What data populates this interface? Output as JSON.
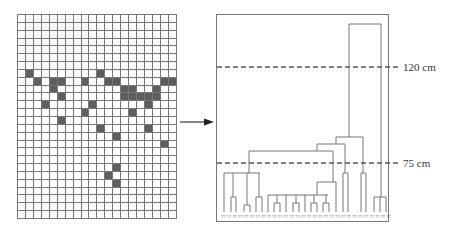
{
  "grid": {
    "cols": 20,
    "rows": 26,
    "cell_w": 7.95,
    "cell_h": 7.85,
    "filled_cells": [
      [
        7,
        1
      ],
      [
        7,
        10
      ],
      [
        8,
        2
      ],
      [
        8,
        4
      ],
      [
        8,
        5
      ],
      [
        8,
        8
      ],
      [
        8,
        11
      ],
      [
        8,
        12
      ],
      [
        8,
        18
      ],
      [
        8,
        19
      ],
      [
        9,
        4
      ],
      [
        9,
        13
      ],
      [
        9,
        14
      ],
      [
        9,
        17
      ],
      [
        10,
        5
      ],
      [
        10,
        13
      ],
      [
        10,
        14
      ],
      [
        10,
        15
      ],
      [
        10,
        16
      ],
      [
        10,
        17
      ],
      [
        11,
        3
      ],
      [
        11,
        9
      ],
      [
        11,
        16
      ],
      [
        12,
        8
      ],
      [
        12,
        14
      ],
      [
        13,
        5
      ],
      [
        14,
        10
      ],
      [
        14,
        16
      ],
      [
        15,
        12
      ],
      [
        16,
        18
      ],
      [
        19,
        12
      ],
      [
        20,
        11
      ],
      [
        21,
        12
      ]
    ]
  },
  "arrow": {
    "label": ""
  },
  "dendrogram": {
    "thresholds": [
      {
        "label": "120 cm",
        "y": 67
      },
      {
        "label": "75 cm",
        "y": 163
      }
    ],
    "leaf_label": "??",
    "leaf_count": 30
  },
  "chart_data": {
    "type": "dendrogram",
    "title": "",
    "annotations": [
      "120 cm",
      "75 cm"
    ],
    "cut_heights_cm": [
      120,
      75
    ],
    "leaf_labels": [
      "??",
      "??",
      "??",
      "??",
      "??",
      "??",
      "??",
      "??",
      "??",
      "??",
      "??",
      "??",
      "??",
      "??",
      "??",
      "??",
      "??",
      "??",
      "??",
      "??",
      "??",
      "??",
      "??",
      "??",
      "??",
      "??",
      "??",
      "??",
      "??",
      "??"
    ]
  }
}
